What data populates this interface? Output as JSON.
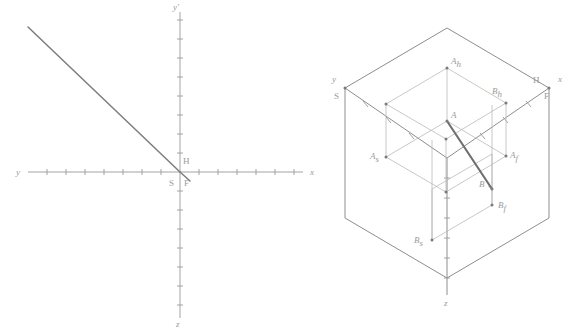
{
  "figure": {
    "background_color": "#ffffff",
    "line_color": "#8e8e8e",
    "accent_color": "#6e6e6e",
    "label_color": "#9b9b9b"
  },
  "left_panel": {
    "name": "coordinate-axes-diagram",
    "axes": {
      "horizontal_left_label": "y",
      "horizontal_right_label": "x",
      "vertical_top_label": "y'",
      "vertical_bottom_label": "z"
    },
    "origin_labels": {
      "upper_right": "H",
      "lower_left": "S",
      "lower_right": "F"
    },
    "tick_count_x_left": 8,
    "tick_count_x_right": 8,
    "tick_count_y_up": 8,
    "tick_count_y_down": 9,
    "tick_spacing_px": 19,
    "segment": {
      "name": "bisector-line",
      "from": [
        28,
        27
      ],
      "to": [
        180,
        172
      ]
    }
  },
  "right_panel": {
    "name": "axonometric-cube-diagram",
    "corner_labels": {
      "left_axis": "y",
      "left_plane": "S",
      "top_center_apex": "",
      "right_vertex": "H",
      "right_axis": "x",
      "right_plane": "F",
      "bottom_axis": "z"
    },
    "points": [
      {
        "id": "A",
        "label": "A",
        "role": "segment-endpoint"
      },
      {
        "id": "B",
        "label": "B",
        "role": "segment-endpoint"
      },
      {
        "id": "A_h",
        "label": "A",
        "sub": "h",
        "role": "horizontal-projection"
      },
      {
        "id": "B_h",
        "label": "B",
        "sub": "h",
        "role": "horizontal-projection"
      },
      {
        "id": "A_f",
        "label": "A",
        "sub": "f",
        "role": "frontal-projection"
      },
      {
        "id": "B_f",
        "label": "B",
        "sub": "f",
        "role": "frontal-projection"
      },
      {
        "id": "A_s",
        "label": "A",
        "sub": "s",
        "role": "side-projection"
      },
      {
        "id": "B_s",
        "label": "B",
        "sub": "s",
        "role": "side-projection"
      }
    ],
    "segment": {
      "name": "segment-AB",
      "from_point": "A",
      "to_point": "B"
    }
  }
}
